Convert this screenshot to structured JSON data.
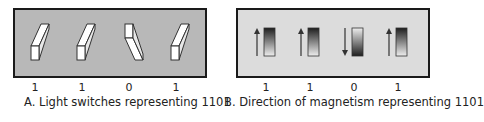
{
  "figures": {
    "a": {
      "caption": "A. Light switches representing 1101",
      "bits": [
        "1",
        "1",
        "0",
        "1"
      ],
      "switch_states": [
        "up",
        "up",
        "down",
        "up"
      ],
      "background": "#b8b8b8"
    },
    "b": {
      "caption": "B. Direction of magnetism representing 1101",
      "bits": [
        "1",
        "1",
        "0",
        "1"
      ],
      "arrow_directions": [
        "up",
        "up",
        "down",
        "up"
      ],
      "background": "#dcdcdc"
    }
  }
}
